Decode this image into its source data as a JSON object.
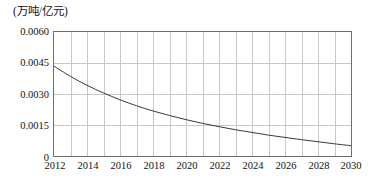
{
  "chart_data": {
    "type": "line",
    "title": "(万吨/亿元)",
    "xlabel": "",
    "ylabel": "(万吨/亿元)",
    "xlim": [
      2012,
      2030
    ],
    "ylim": [
      0,
      0.006
    ],
    "grid": true,
    "legend": false,
    "x_tick_labels": [
      "2012",
      "2014",
      "2016",
      "2018",
      "2020",
      "2022",
      "2024",
      "2026",
      "2028",
      "2030"
    ],
    "x_tick_values": [
      2012,
      2014,
      2016,
      2018,
      2020,
      2022,
      2024,
      2026,
      2028,
      2030
    ],
    "y_tick_labels": [
      "0",
      "0.0015",
      "0.0030",
      "0.0045",
      "0.0060"
    ],
    "y_tick_values": [
      0,
      0.0015,
      0.003,
      0.0045,
      0.006
    ],
    "minor_x_gridline_step": 1,
    "series": [
      {
        "name": "单位GDP能耗强度",
        "x": [
          2012,
          2013,
          2014,
          2015,
          2016,
          2017,
          2018,
          2019,
          2020,
          2021,
          2022,
          2023,
          2024,
          2025,
          2026,
          2027,
          2028,
          2029,
          2030
        ],
        "values": [
          0.00435,
          0.00385,
          0.00342,
          0.00305,
          0.00272,
          0.00243,
          0.00218,
          0.00196,
          0.00176,
          0.00158,
          0.00142,
          0.00127,
          0.00114,
          0.00101,
          0.0009,
          0.00079,
          0.00069,
          0.00059,
          0.0005
        ]
      }
    ],
    "colors": {
      "line": "#3a3a3a",
      "grid": "#c8c8c8",
      "frame": "#6e6e6e",
      "background": "#ffffff",
      "text": "#121212"
    }
  }
}
